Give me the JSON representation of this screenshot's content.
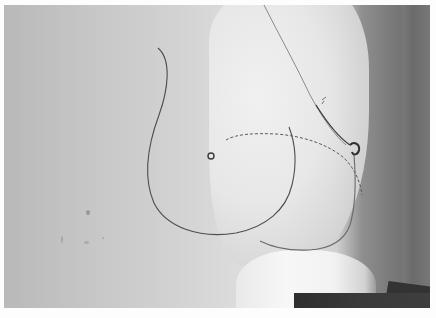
{
  "image": {
    "kind": "photograph",
    "color_mode": "grayscale",
    "description": "Black-and-white photograph of a white anatomical breast model in profile against a wall, with an outline drawn in thin dark line, a small circle mark, and a dashed curve",
    "colors": {
      "wall_left": "#b9b9b9",
      "wall_highlight": "#e6e6e6",
      "shadow_right": "#6e6e6e",
      "model_body": "#ececec",
      "line": "#4a4a4a",
      "dark_object": "#333333",
      "border": "#fdfdfd"
    },
    "elements": {
      "outline_curve": "thin drawn outline curve",
      "center_mark": "small circle mark",
      "dashed_curve": "dashed curve line",
      "profile_edge": "model profile edge with nipple",
      "lower_fold": "lower fold line"
    }
  }
}
